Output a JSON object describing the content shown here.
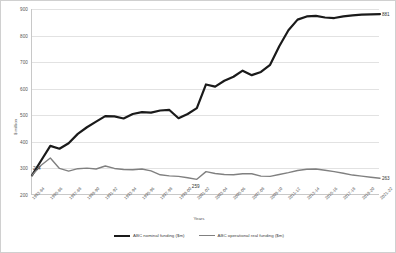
{
  "chart_data": {
    "type": "line",
    "title": "",
    "xlabel": "Years",
    "ylabel": "$ million",
    "ylim": [
      200,
      900
    ],
    "yticks": [
      200,
      300,
      400,
      500,
      600,
      700,
      800,
      900
    ],
    "grid": true,
    "legend_position": "bottom",
    "x": [
      "1983-84",
      "1984-85",
      "1985-86",
      "1986-87",
      "1987-88",
      "1988-89",
      "1989-90",
      "1990-91",
      "1991-92",
      "1992-93",
      "1993-94",
      "1994-95",
      "1995-96",
      "1996-97",
      "1997-98",
      "1998-99",
      "1999-00",
      "2000-01",
      "2001-02",
      "2002-03",
      "2003-04",
      "2004-05",
      "2005-06",
      "2006-07",
      "2007-08",
      "2008-09",
      "2009-10",
      "2010-11",
      "2011-12",
      "2012-13",
      "2013-14",
      "2014-15",
      "2015-16",
      "2016-17",
      "2017-18",
      "2018-19",
      "2019-20",
      "2020-21",
      "2021-22"
    ],
    "xtick_labels": [
      "1983-84",
      "1985-86",
      "1987-88",
      "1989-90",
      "1991-92",
      "1993-94",
      "1995-96",
      "1997-98",
      "1999-00",
      "2001-02",
      "2003-04",
      "2005-06",
      "2007-08",
      "2009-10",
      "2011-12",
      "2013-14",
      "2015-16",
      "2017-18",
      "2019-20",
      "2021-22"
    ],
    "series": [
      {
        "name": "ABC nominal funding ($m)",
        "color": "#1a1a1a",
        "values": [
          274,
          330,
          385,
          374,
          395,
          430,
          455,
          476,
          497,
          496,
          488,
          505,
          512,
          510,
          518,
          520,
          489,
          505,
          527,
          616,
          608,
          630,
          645,
          668,
          651,
          663,
          690,
          760,
          820,
          860,
          872,
          874,
          868,
          866,
          872,
          876,
          879,
          880,
          881
        ]
      },
      {
        "name": "ABC operational real funding ($m)",
        "color": "#808080",
        "values": [
          274,
          312,
          339,
          300,
          290,
          299,
          301,
          298,
          309,
          300,
          296,
          295,
          298,
          291,
          276,
          272,
          270,
          265,
          259,
          288,
          281,
          277,
          276,
          280,
          280,
          271,
          270,
          277,
          284,
          292,
          297,
          298,
          293,
          288,
          282,
          275,
          271,
          267,
          263
        ]
      }
    ],
    "annotations": [
      {
        "label": "214",
        "series": "ABC nominal funding ($m)",
        "x": "1983-84"
      },
      {
        "label": "259",
        "series": "ABC operational real funding ($m)",
        "x": "2001-02"
      },
      {
        "label": "881",
        "series": "ABC nominal funding ($m)",
        "x": "2021-22"
      },
      {
        "label": "263",
        "series": "ABC operational real funding ($m)",
        "x": "2021-22"
      }
    ]
  }
}
